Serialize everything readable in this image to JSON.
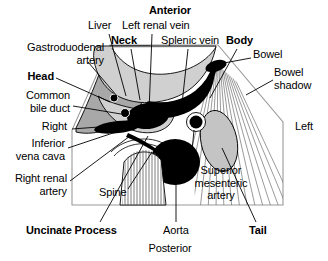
{
  "diagram": {
    "title_orientation_top": "Anterior",
    "title_orientation_bottom": "Posterior",
    "orientation_left": "Right",
    "orientation_right": "Left",
    "colors": {
      "background": "#ffffff",
      "outline": "#000000",
      "liver_gray": "#a8a8a8",
      "pancreas_gray": "#d0d0d0",
      "tail_gray": "#c4c4c4",
      "vessel_black": "#000000",
      "frame_gray": "#9a9a9a",
      "hatch_gray": "#7a7a7a"
    },
    "labels": [
      {
        "id": "anterior",
        "text": "Anterior",
        "bold": true,
        "x": 170,
        "y": 6,
        "align": "center"
      },
      {
        "id": "liver",
        "text": "Liver",
        "bold": false,
        "x": 98,
        "y": 22,
        "align": "left"
      },
      {
        "id": "left-renal-vein",
        "text": "Left renal vein",
        "bold": false,
        "x": 127,
        "y": 22,
        "align": "left"
      },
      {
        "id": "neck",
        "text": "Neck",
        "bold": true,
        "x": 115,
        "y": 37,
        "align": "left"
      },
      {
        "id": "splenic-vein",
        "text": "Splenic vein",
        "bold": false,
        "x": 163,
        "y": 37,
        "align": "left"
      },
      {
        "id": "body",
        "text": "Body",
        "bold": true,
        "x": 228,
        "y": 37,
        "align": "left"
      },
      {
        "id": "gastroduodenal-artery",
        "text": "Gastroduodenal\nartery",
        "bold": false,
        "x": 20,
        "y": 44,
        "align": "left"
      },
      {
        "id": "bowel",
        "text": "Bowel",
        "bold": false,
        "x": 253,
        "y": 51,
        "align": "left"
      },
      {
        "id": "bowel-shadow",
        "text": "Bowel\nshadow",
        "bold": false,
        "x": 275,
        "y": 70,
        "align": "left"
      },
      {
        "id": "head",
        "text": "Head",
        "bold": true,
        "x": 22,
        "y": 73,
        "align": "left"
      },
      {
        "id": "common-bile-duct",
        "text": "Common\nbile duct",
        "bold": false,
        "x": 18,
        "y": 93,
        "align": "left"
      },
      {
        "id": "right",
        "text": "Right",
        "bold": false,
        "x": 38,
        "y": 125,
        "align": "left"
      },
      {
        "id": "left",
        "text": "Left",
        "bold": false,
        "x": 295,
        "y": 125,
        "align": "left"
      },
      {
        "id": "inferior-vena-cava",
        "text": "Inferior\nvena cava",
        "bold": false,
        "x": 18,
        "y": 142,
        "align": "left"
      },
      {
        "id": "right-renal-artery",
        "text": "Right renal\nartery",
        "bold": false,
        "x": 10,
        "y": 175,
        "align": "left"
      },
      {
        "id": "spine",
        "text": "Spine",
        "bold": false,
        "x": 100,
        "y": 190,
        "align": "left"
      },
      {
        "id": "superior-mesenteric-artery",
        "text": "Superior\nmesenteric\nartery",
        "bold": false,
        "x": 192,
        "y": 168,
        "align": "left"
      },
      {
        "id": "uncinate-process",
        "text": "Uncinate Process",
        "bold": true,
        "x": 28,
        "y": 228,
        "align": "left"
      },
      {
        "id": "aorta",
        "text": "Aorta",
        "bold": false,
        "x": 165,
        "y": 228,
        "align": "left"
      },
      {
        "id": "tail",
        "text": "Tail",
        "bold": true,
        "x": 250,
        "y": 228,
        "align": "left"
      },
      {
        "id": "posterior",
        "text": "Posterior",
        "bold": false,
        "x": 170,
        "y": 246,
        "align": "center"
      }
    ],
    "structures": [
      {
        "id": "liver",
        "name": "Liver",
        "fill": "liver_gray"
      },
      {
        "id": "pancreas-head",
        "name": "Head",
        "fill": "pancreas_gray"
      },
      {
        "id": "pancreas-neck",
        "name": "Neck",
        "fill": "pancreas_gray"
      },
      {
        "id": "pancreas-body",
        "name": "Body",
        "fill": "pancreas_gray"
      },
      {
        "id": "pancreas-tail",
        "name": "Tail",
        "fill": "tail_gray"
      },
      {
        "id": "uncinate-process",
        "name": "Uncinate Process",
        "fill": "pancreas_gray"
      },
      {
        "id": "splenic-vein",
        "name": "Splenic vein",
        "fill": "vessel_black"
      },
      {
        "id": "left-renal-vein",
        "name": "Left renal vein",
        "fill": "vessel_black"
      },
      {
        "id": "aorta",
        "name": "Aorta",
        "fill": "vessel_black"
      },
      {
        "id": "superior-mesenteric-artery",
        "name": "Superior mesenteric artery",
        "fill": "vessel_black"
      },
      {
        "id": "inferior-vena-cava",
        "name": "Inferior vena cava",
        "fill": "vessel_black"
      },
      {
        "id": "gastroduodenal-artery",
        "name": "Gastroduodenal artery",
        "fill": "vessel_black"
      },
      {
        "id": "common-bile-duct",
        "name": "Common bile duct",
        "fill": "vessel_black"
      },
      {
        "id": "right-renal-artery",
        "name": "Right renal artery",
        "fill": "vessel_black"
      },
      {
        "id": "bowel",
        "name": "Bowel",
        "fill": "vessel_black"
      },
      {
        "id": "bowel-shadow",
        "name": "Bowel shadow",
        "fill": "hatch_gray"
      },
      {
        "id": "spine",
        "name": "Spine",
        "fill": "hatch_gray"
      }
    ]
  }
}
